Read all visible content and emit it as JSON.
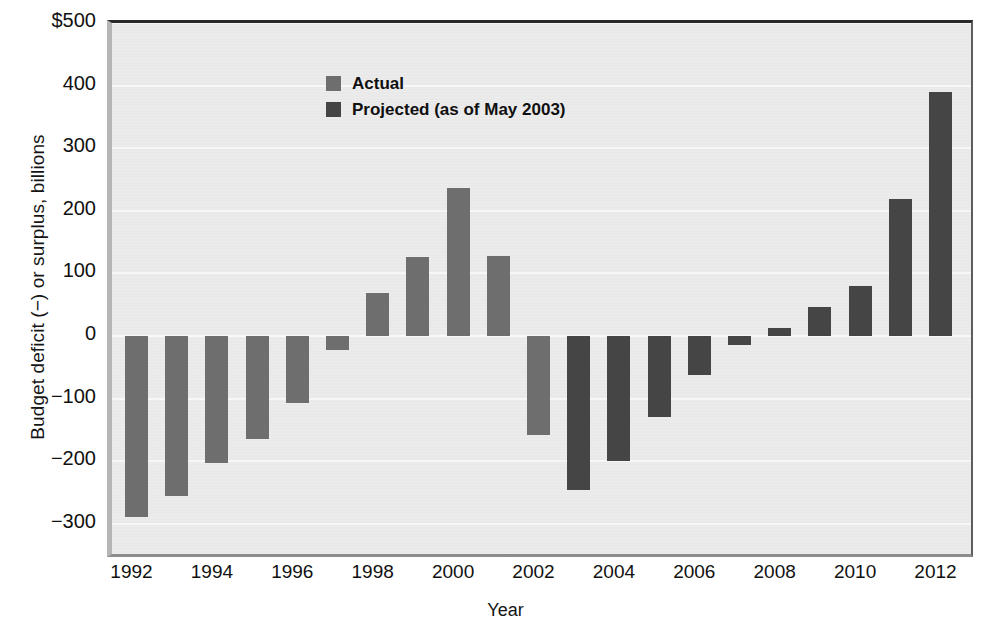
{
  "chart_data": {
    "type": "bar",
    "title": "",
    "xlabel": "Year",
    "ylabel": "Budget deficit (−) or surplus, billions",
    "ylim": [
      -350,
      500
    ],
    "ytick_labels": [
      "$500",
      "400",
      "300",
      "200",
      "100",
      "0",
      "−100",
      "−200",
      "−300"
    ],
    "ytick_values": [
      500,
      400,
      300,
      200,
      100,
      0,
      -100,
      -200,
      -300
    ],
    "xtick_labels": [
      "1992",
      "1994",
      "1996",
      "1998",
      "2000",
      "2002",
      "2004",
      "2006",
      "2008",
      "2010",
      "2012"
    ],
    "xtick_values": [
      1992,
      1994,
      1996,
      1998,
      2000,
      2002,
      2004,
      2006,
      2008,
      2010,
      2012
    ],
    "grid": true,
    "legend_position": "upper-left",
    "legend": [
      {
        "key": "actual",
        "label": "Actual",
        "color": "#6e6e6e"
      },
      {
        "key": "projected",
        "label": "Projected (as of May 2003)",
        "color": "#454545"
      }
    ],
    "categories": [
      1992,
      1993,
      1994,
      1995,
      1996,
      1997,
      1998,
      1999,
      2000,
      2001,
      2002,
      2003,
      2004,
      2005,
      2006,
      2007,
      2008,
      2009,
      2010,
      2011,
      2012
    ],
    "values": [
      -290,
      -255,
      -203,
      -164,
      -107,
      -22,
      69,
      126,
      236,
      127,
      -158,
      -246,
      -200,
      -130,
      -62,
      -14,
      13,
      47,
      80,
      218,
      390
    ],
    "series_key": [
      "actual",
      "actual",
      "actual",
      "actual",
      "actual",
      "actual",
      "actual",
      "actual",
      "actual",
      "actual",
      "actual",
      "projected",
      "projected",
      "projected",
      "projected",
      "projected",
      "projected",
      "projected",
      "projected",
      "projected",
      "projected"
    ]
  },
  "colors": {
    "actual": "#6e6e6e",
    "projected": "#454545",
    "plot_background": "#e9e9e9",
    "gridline": "#f7f7f7",
    "text": "#111111"
  }
}
